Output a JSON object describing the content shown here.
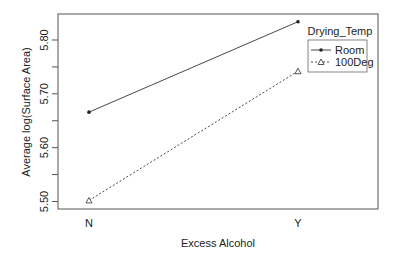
{
  "chart_data": {
    "type": "line",
    "title": "",
    "xlabel": "Excess Alcohol",
    "ylabel": "Average log(Surface Area)",
    "categories": [
      "N",
      "Y"
    ],
    "yticks": [
      "5.50",
      "5.60",
      "5.70",
      "5.80"
    ],
    "ylim": [
      5.49,
      5.847
    ],
    "legend_title": "Drying_Temp",
    "legend_position": "upper-right-outside-inset",
    "grid": false,
    "series": [
      {
        "name": "Room",
        "values": [
          5.666,
          5.834
        ],
        "marker": "dot",
        "line": "solid"
      },
      {
        "name": "100Deg",
        "values": [
          5.502,
          5.742
        ],
        "marker": "triangle",
        "line": "dashed"
      }
    ]
  }
}
